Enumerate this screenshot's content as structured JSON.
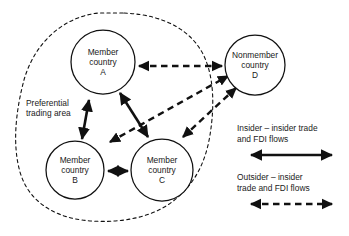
{
  "figure": {
    "type": "concept-diagram",
    "title_visible": false,
    "background_color": "#ffffff",
    "line_color": "#111111"
  },
  "area": {
    "name": "preferential-trading-area",
    "label_line1": "Preferential",
    "label_line2": "trading area",
    "boundary_style": "dashed"
  },
  "nodes": [
    {
      "id": "A",
      "name": "member-country-a",
      "line1": "Member",
      "line2": "country",
      "line3": "A",
      "inside_area": true,
      "cx": 103,
      "cy": 62,
      "r": 32
    },
    {
      "id": "B",
      "name": "member-country-b",
      "line1": "Member",
      "line2": "country",
      "line3": "B",
      "inside_area": true,
      "cx": 75,
      "cy": 170,
      "r": 29
    },
    {
      "id": "C",
      "name": "member-country-c",
      "line1": "Member",
      "line2": "country",
      "line3": "C",
      "inside_area": true,
      "cx": 162,
      "cy": 170,
      "r": 31
    },
    {
      "id": "D",
      "name": "nonmember-country-d",
      "line1": "Nonmember",
      "line2": "country",
      "line3": "D",
      "inside_area": false,
      "cx": 255,
      "cy": 65,
      "r": 30
    }
  ],
  "edges": [
    {
      "name": "edge-a-d",
      "from": "A",
      "to": "D",
      "style": "dashed",
      "arrows": "both"
    },
    {
      "name": "edge-a-b",
      "from": "A",
      "to": "B",
      "style": "solid",
      "arrows": "both"
    },
    {
      "name": "edge-a-c",
      "from": "A",
      "to": "C",
      "style": "solid",
      "arrows": "both"
    },
    {
      "name": "edge-b-c",
      "from": "B",
      "to": "C",
      "style": "solid",
      "arrows": "both"
    },
    {
      "name": "edge-b-d",
      "from": "B",
      "to": "D",
      "style": "dashed",
      "arrows": "both"
    },
    {
      "name": "edge-c-d",
      "from": "C",
      "to": "D",
      "style": "dashed",
      "arrows": "both"
    }
  ],
  "legend": {
    "name": "flow-legend",
    "entries": [
      {
        "name": "legend-insider-insider",
        "line1": "Insider – insider trade",
        "line2": "and FDI flows",
        "style": "solid",
        "arrows": "both"
      },
      {
        "name": "legend-outsider-insider",
        "line1": "Outsider – insider",
        "line2": "trade and FDI flows",
        "style": "dashed",
        "arrows": "both"
      }
    ]
  }
}
